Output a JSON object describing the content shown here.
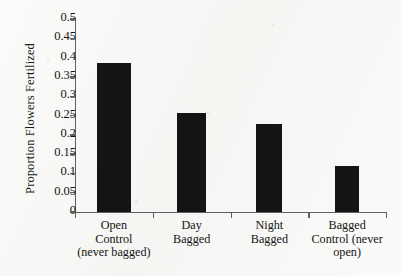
{
  "chart_data": {
    "type": "bar",
    "title": "",
    "xlabel": "",
    "ylabel": "Proportion Flowers Fertilized",
    "ylim": [
      0,
      0.5
    ],
    "grid": false,
    "legend": false,
    "bar_color": "#141414",
    "axis_color": "#5f5f5f",
    "background": "#f6f6f4",
    "categories": [
      "Open\nControl\n(never bagged)",
      "Day\nBagged",
      "Night\nBagged",
      "Bagged\nControl (never\nopen)"
    ],
    "category_lines": [
      [
        "Open",
        "Control",
        "(never bagged)"
      ],
      [
        "Day",
        "Bagged"
      ],
      [
        "Night",
        "Bagged"
      ],
      [
        "Bagged",
        "Control (never",
        "open)"
      ]
    ],
    "values": [
      0.386,
      0.256,
      0.228,
      0.119
    ],
    "ytick_labels": [
      "0.5",
      "0.45",
      "0.4",
      "0.35",
      "0.3",
      "0.25",
      "0.2",
      "0.15",
      "0.1",
      "0.05",
      "0"
    ],
    "ytick_values": [
      0.5,
      0.45,
      0.4,
      0.35,
      0.3,
      0.25,
      0.2,
      0.15,
      0.1,
      0.05,
      0
    ]
  }
}
